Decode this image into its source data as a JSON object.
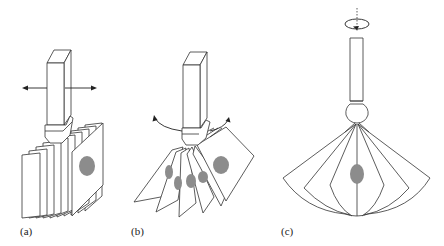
{
  "figure": {
    "panels": [
      {
        "id": "a",
        "label": "(a)",
        "description": "Rigid rod with clamp holding a stack of parallel sheets; horizontal translation arrows left and right"
      },
      {
        "id": "b",
        "label": "(b)",
        "description": "Rod with clamp holding sheets fanned out; curved arrows indicating rocking motion"
      },
      {
        "id": "c",
        "label": "(c)",
        "description": "Vertical rod with ball joint holding sheets spread radially like a fan; rotation arrow around vertical dotted axis"
      }
    ],
    "colors": {
      "line": "#333333",
      "blob": "#8c8c8c",
      "background": "#ffffff"
    }
  }
}
